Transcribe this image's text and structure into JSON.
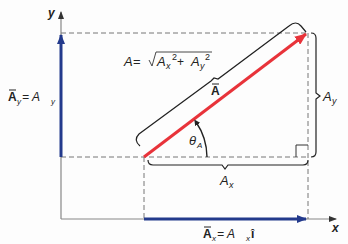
{
  "diagram": {
    "axes": {
      "x_label": "x",
      "y_label": "y"
    },
    "vector": {
      "name": "A",
      "color": "#e8333a"
    },
    "component_color": "#233a8c",
    "labels": {
      "magnitude_lhs": "A",
      "magnitude_eq": " = ",
      "ax": "A",
      "ax_sub": "x",
      "ay": "A",
      "ay_sub": "y",
      "sq": "2",
      "plus": " + ",
      "theta": "θ",
      "theta_sub": "A",
      "vec_A": "A",
      "Ax_bracket": "A",
      "Ax_bracket_sub": "x",
      "Ay_bracket": "A",
      "Ay_bracket_sub": "y",
      "Ax_vec": "A",
      "Ax_vec_sub": "x",
      "Ax_eq": " = A",
      "Ax_eq_sub": "x",
      "Ax_unit": "î",
      "Ay_vec": "A",
      "Ay_vec_sub": "y",
      "Ay_eq": " = A",
      "Ay_eq_sub": "y",
      "Ay_unit": "ĵ"
    }
  }
}
